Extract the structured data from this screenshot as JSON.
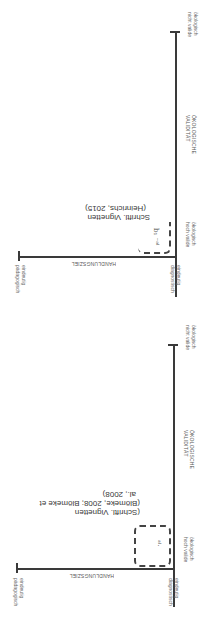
{
  "diagrams": [
    {
      "id": "top",
      "y_axis": {
        "title_line1": "ÖKOLOGISCHE",
        "title_line2": "VALIDITÄT",
        "top_label_line1": "ökologisch",
        "top_label_line2": "nicht valide",
        "bottom_label_line1": "ökologisch",
        "bottom_label_line2": "hoch valide"
      },
      "x_axis": {
        "title": "HANDLUNGSZIEL",
        "left_label_line1": "eindeutig",
        "left_label_line2": "pädagogisch",
        "right_label_line1": "eindeutig",
        "right_label_line2": "diagnostisch"
      },
      "region": {
        "citation_line1": "Schriftl. Vignetten",
        "citation_line2": "(Heinrichs, 2015)",
        "marker": "b₁ ⁻ᵃˡ"
      }
    },
    {
      "id": "bottom",
      "y_axis": {
        "title_line1": "ÖKOLOGISCHE",
        "title_line2": "VALIDITÄT",
        "top_label_line1": "ökologisch",
        "top_label_line2": "nicht valide",
        "bottom_label_line1": "ökologisch",
        "bottom_label_line2": "hoch valide"
      },
      "x_axis": {
        "title": "HANDLUNGSZIEL",
        "left_label_line1": "eindeutig",
        "left_label_line2": "pädagogisch",
        "right_label_line1": "eindeutig",
        "right_label_line2": "diagnostisch"
      },
      "region": {
        "citation_line1": "(Schriftl. Vignetten",
        "citation_line2": "(Blömeke, 2008; Blömeke et",
        "citation_line3": "al., 2008)",
        "marker": "ᵃˡ·"
      }
    }
  ]
}
